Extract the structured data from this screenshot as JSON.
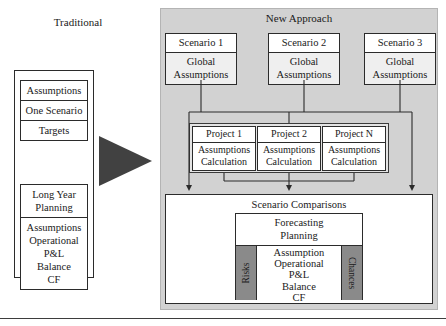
{
  "traditional": {
    "title": "Traditional",
    "group_top": [
      "Assumptions",
      "One Scenario",
      "Targets"
    ],
    "group_bottom_head": [
      "Long Year",
      "Planning"
    ],
    "group_bottom_lines": [
      "Assumptions",
      "Operational",
      "P&L",
      "Balance",
      "CF"
    ]
  },
  "arrow": {
    "name": "transition-arrow",
    "color": "#414141"
  },
  "new_approach": {
    "title": "New Approach",
    "panel_color": "#d2d2d2",
    "scenarios": [
      {
        "head": "Scenario 1",
        "body_line1": "Global",
        "body_line2": "Assumptions"
      },
      {
        "head": "Scenario 2",
        "body_line1": "Global",
        "body_line2": "Assumptions"
      },
      {
        "head": "Scenario 3",
        "body_line1": "Global",
        "body_line2": "Assumptions"
      }
    ],
    "projects": [
      {
        "head": "Project 1",
        "body_line1": "Assumptions",
        "body_line2": "Calculation"
      },
      {
        "head": "Project 2",
        "body_line1": "Assumptions",
        "body_line2": "Calculation"
      },
      {
        "head": "Project N",
        "body_line1": "Assumptions",
        "body_line2": "Calculation"
      }
    ],
    "comparisons": {
      "label": "Scenario Comparisons",
      "forecast_head_line1": "Forecasting",
      "forecast_head_line2": "Planning",
      "left_label": "Risks",
      "right_label": "Chances",
      "side_color": "#8a8a8a",
      "center_lines": [
        "Assumption",
        "Operational",
        "P&L",
        "Balance",
        "CF"
      ]
    }
  }
}
